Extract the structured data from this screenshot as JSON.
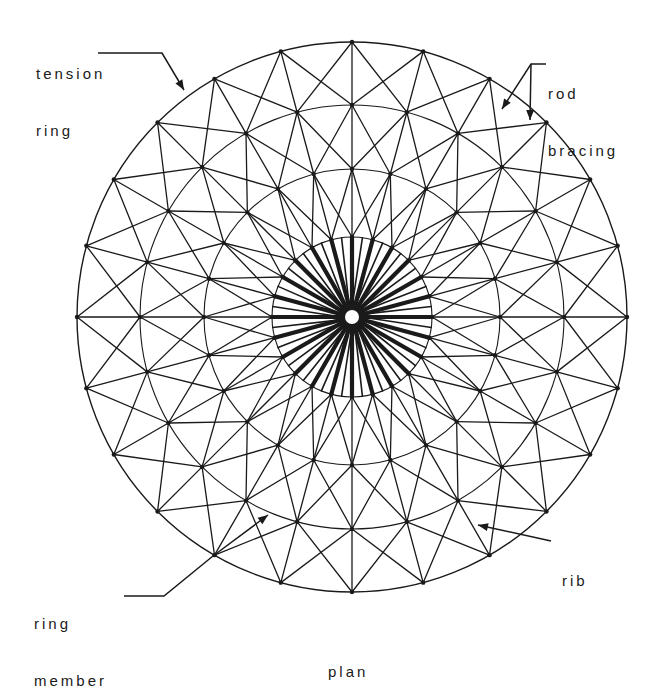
{
  "diagram": {
    "caption": "plan",
    "colors": {
      "line": "#1a1a1a",
      "background": "#ffffff"
    },
    "geometry": {
      "center": [
        352,
        317
      ],
      "ring_radii": [
        80,
        148,
        212,
        275
      ],
      "ribs": 24,
      "hub_radius": 8,
      "inner_rib_width": 4.2,
      "member_width": 1.3
    },
    "labels": [
      {
        "id": "tension-ring",
        "lines": [
          "tension",
          "ring"
        ],
        "x": 36,
        "y": 26
      },
      {
        "id": "rod-bracing",
        "lines": [
          "rod",
          "bracing"
        ],
        "x": 548,
        "y": 46
      },
      {
        "id": "ring-member",
        "lines": [
          "ring",
          "member"
        ],
        "x": 34,
        "y": 576
      },
      {
        "id": "rib",
        "lines": [
          "rib"
        ],
        "x": 562,
        "y": 533
      }
    ],
    "leaders": [
      {
        "id": "tension-ring-leader",
        "points": [
          [
            98,
            53
          ],
          [
            162,
            53
          ],
          [
            184,
            90
          ]
        ]
      },
      {
        "id": "rod-bracing-leader-1",
        "points": [
          [
            546,
            64
          ],
          [
            531,
            64
          ],
          [
            502,
            109
          ]
        ]
      },
      {
        "id": "rod-bracing-leader-2",
        "points": [
          [
            531,
            64
          ],
          [
            530,
            120
          ]
        ]
      },
      {
        "id": "ring-member-leader",
        "points": [
          [
            124,
            596
          ],
          [
            164,
            596
          ],
          [
            213,
            556
          ]
        ]
      },
      {
        "id": "ring-member-arrow",
        "points": [
          [
            213,
            556
          ],
          [
            268,
            515
          ]
        ]
      },
      {
        "id": "rib-leader",
        "points": [
          [
            551,
            541
          ],
          [
            478,
            525
          ]
        ]
      }
    ]
  }
}
